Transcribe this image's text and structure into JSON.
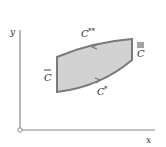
{
  "diagram": {
    "axes": {
      "x_label": "x",
      "y_label": "y",
      "origin_marker": "open-circle"
    },
    "region": {
      "fill": "#d2d2d2",
      "stroke": "#7a7a7a"
    },
    "curves": {
      "top": {
        "label": "C",
        "superscript": "**"
      },
      "bottom": {
        "label": "C",
        "superscript": "*"
      },
      "left": {
        "label": "C",
        "accent": "bar"
      },
      "right": {
        "label": "C",
        "accent": "triple-bar"
      }
    },
    "colors": {
      "axis": "#888888",
      "text": "#333333"
    }
  }
}
